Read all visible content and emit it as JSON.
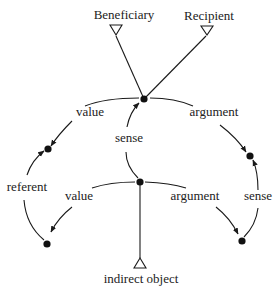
{
  "diagram": {
    "type": "semantic-network",
    "colors": {
      "ink": "#1a1a1a",
      "background": "#ffffff"
    },
    "terminals": {
      "beneficiary": "Beneficiary",
      "recipient": "Recipient",
      "indirect_object": "indirect object"
    },
    "edge_labels": {
      "top_value": "value",
      "top_argument": "argument",
      "sense_center": "sense",
      "referent": "referent",
      "mid_value": "value",
      "mid_argument": "argument",
      "sense_right": "sense"
    },
    "nodes": [
      {
        "id": "top",
        "x": 144,
        "y": 99
      },
      {
        "id": "middle",
        "x": 140,
        "y": 182
      },
      {
        "id": "left-upper",
        "x": 48,
        "y": 149
      },
      {
        "id": "left-lower",
        "x": 47,
        "y": 244
      },
      {
        "id": "right-upper",
        "x": 250,
        "y": 156
      },
      {
        "id": "right-lower",
        "x": 242,
        "y": 241
      }
    ]
  }
}
